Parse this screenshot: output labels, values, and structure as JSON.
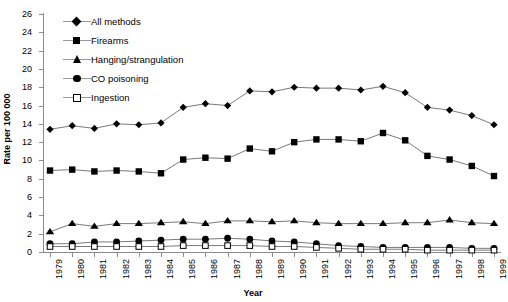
{
  "chart_data": {
    "type": "line",
    "title": "",
    "xlabel": "Year",
    "ylabel": "Rate per 100 000",
    "grid": false,
    "legend_position": "top-left inside plot",
    "ylim": [
      0,
      26
    ],
    "yticks": [
      0,
      2,
      4,
      6,
      8,
      10,
      12,
      14,
      16,
      18,
      20,
      22,
      24,
      26
    ],
    "categories": [
      "1979",
      "1980",
      "1981",
      "1982",
      "1983",
      "1984",
      "1985",
      "1986",
      "1987",
      "1988",
      "1989",
      "1990",
      "1991",
      "1992",
      "1993",
      "1994",
      "1995",
      "1996",
      "1997",
      "1998",
      "1999"
    ],
    "x": [
      1979,
      1980,
      1981,
      1982,
      1983,
      1984,
      1985,
      1986,
      1987,
      1988,
      1989,
      1990,
      1991,
      1992,
      1993,
      1994,
      1995,
      1996,
      1997,
      1998,
      1999
    ],
    "series": [
      {
        "name": "All methods",
        "marker": "diamond",
        "color": "#000000",
        "values": [
          13.4,
          13.8,
          13.5,
          14.0,
          13.9,
          14.1,
          15.8,
          16.2,
          16.0,
          17.6,
          17.5,
          18.0,
          17.9,
          17.9,
          17.7,
          18.1,
          17.4,
          15.8,
          15.5,
          14.9,
          13.9
        ]
      },
      {
        "name": "Firearms",
        "marker": "square",
        "color": "#000000",
        "values": [
          8.9,
          9.0,
          8.8,
          8.9,
          8.8,
          8.6,
          10.1,
          10.3,
          10.2,
          11.3,
          11.0,
          12.0,
          12.3,
          12.3,
          12.1,
          13.0,
          12.2,
          10.5,
          10.1,
          9.4,
          8.3
        ]
      },
      {
        "name": "Hanging/strangulation",
        "marker": "triangle",
        "color": "#000000",
        "values": [
          2.2,
          3.1,
          2.8,
          3.1,
          3.1,
          3.2,
          3.3,
          3.1,
          3.4,
          3.4,
          3.3,
          3.4,
          3.2,
          3.1,
          3.1,
          3.1,
          3.2,
          3.2,
          3.5,
          3.2,
          3.1
        ]
      },
      {
        "name": "CO poisoning",
        "marker": "circle",
        "color": "#000000",
        "values": [
          0.9,
          0.9,
          1.1,
          1.1,
          1.2,
          1.3,
          1.4,
          1.4,
          1.5,
          1.4,
          1.2,
          1.1,
          0.9,
          0.7,
          0.6,
          0.5,
          0.5,
          0.5,
          0.5,
          0.4,
          0.4
        ]
      },
      {
        "name": "Ingestion",
        "marker": "open-square",
        "color": "#000000",
        "values": [
          0.6,
          0.6,
          0.6,
          0.6,
          0.6,
          0.6,
          0.7,
          0.7,
          0.7,
          0.7,
          0.6,
          0.6,
          0.5,
          0.4,
          0.3,
          0.3,
          0.3,
          0.2,
          0.2,
          0.2,
          0.2
        ]
      }
    ]
  },
  "axes": {
    "y_title": "Rate per 100 000",
    "x_title": "Year",
    "y_tick_labels": [
      "26",
      "24",
      "22",
      "20",
      "18",
      "16",
      "14",
      "12",
      "10",
      "8",
      "6",
      "4",
      "2",
      "0"
    ],
    "x_tick_labels": [
      "1979",
      "1980",
      "1981",
      "1982",
      "1983",
      "1984",
      "1985",
      "1986",
      "1987",
      "1988",
      "1989",
      "1990",
      "1991",
      "1992",
      "1993",
      "1994",
      "1995",
      "1996",
      "1997",
      "1998",
      "1999"
    ]
  },
  "legend": {
    "items": [
      {
        "label": "All methods",
        "marker": "diamond"
      },
      {
        "label": "Firearms",
        "marker": "square"
      },
      {
        "label": "Hanging/strangulation",
        "marker": "triangle"
      },
      {
        "label": "CO poisoning",
        "marker": "circle"
      },
      {
        "label": "Ingestion",
        "marker": "open-square"
      }
    ]
  },
  "colors": {
    "series": "#000000",
    "axis": "#8a8a8a",
    "line": "#7a7a7a",
    "background": "#ffffff"
  }
}
